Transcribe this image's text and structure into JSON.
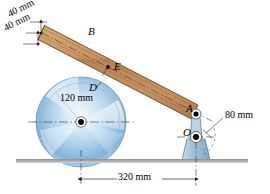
{
  "figure": {
    "background_color": "#ffffff"
  },
  "labels": {
    "thickness_upper": "40 mm",
    "thickness_lower": "40 mm",
    "bar_point_B": "B",
    "bar_point_E": "E",
    "disk_point_D": "D",
    "disk_radius": "120 mm",
    "pin_A": "A",
    "pin_O": "O",
    "crank_radius": "80 mm",
    "base_distance": "320 mm"
  },
  "colors": {
    "bar_fill": "#c08b5c",
    "bar_fill_light": "#d9a878",
    "bar_edge": "#6b4423",
    "disk_blue_light": "#dceaf6",
    "disk_blue_mid": "#a8cbe6",
    "disk_blue_deep": "#5f9bcd",
    "bracket_fill": "#a9c4d9",
    "bracket_edge": "#5b7f9b",
    "ground": "#9a9a9a",
    "line": "#1a1a1a",
    "hub": "#000000"
  },
  "geometry": {
    "disk_center": [
      81,
      122
    ],
    "disk_radius_px": 45,
    "pin_A": [
      196,
      114
    ],
    "pin_O": [
      196,
      137
    ],
    "ground_y": 160,
    "span_320_left_x": 81,
    "span_320_right_x": 196
  }
}
